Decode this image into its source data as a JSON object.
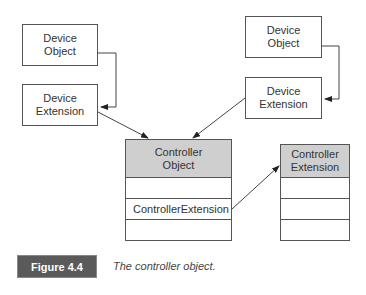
{
  "diagram": {
    "left_device_object": {
      "line1": "Device",
      "line2": "Object"
    },
    "left_device_extension": {
      "line1": "Device",
      "line2": "Extension"
    },
    "right_device_object": {
      "line1": "Device",
      "line2": "Object"
    },
    "right_device_extension": {
      "line1": "Device",
      "line2": "Extension"
    },
    "controller_object": {
      "header_line1": "Controller",
      "header_line2": "Object",
      "rows": [
        "",
        "ControllerExtension",
        ""
      ],
      "header_color": "#cfcfcf"
    },
    "controller_extension": {
      "header_line1": "Controller",
      "header_line2": "Extension",
      "rows": [
        "",
        "",
        ""
      ],
      "header_color": "#cfcfcf"
    }
  },
  "figure": {
    "label": "Figure 4.4",
    "caption": "The controller object.",
    "label_color": "#5a5a5a"
  }
}
